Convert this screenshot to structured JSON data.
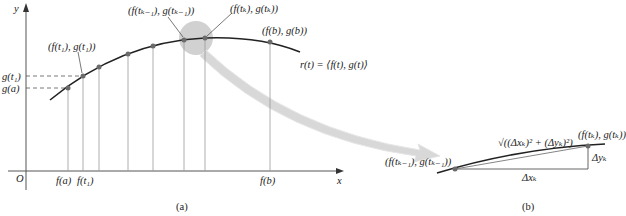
{
  "figure_a": {
    "caption": "(a)",
    "axis_x_label": "x",
    "axis_y_label": "y",
    "origin_label": "O",
    "point_labels": {
      "p1": "(f(t₁), g(t₁))",
      "pk_minus_1": "(f(tₖ₋₁), g(tₖ₋₁))",
      "pk": "(f(tₖ), g(tₖ))",
      "pb": "(f(b), g(b))"
    },
    "curve_label": "r(t) = ⟨f(t), g(t)⟩",
    "x_ticks": [
      "f(a)",
      "f(t₁)",
      "f(b)"
    ],
    "y_ticks": [
      "g(t₁)",
      "g(a)"
    ]
  },
  "figure_b": {
    "caption": "(b)",
    "segment_label": "√((Δxₖ)² + (Δyₖ)²)",
    "left_point_label": "(f(tₖ₋₁), g(tₖ₋₁))",
    "right_point_label": "(f(tₖ), g(tₖ))",
    "dx_label": "Δxₖ",
    "dy_label": "Δyₖ"
  },
  "colors": {
    "curve": "#2a2a2a",
    "point": "#6b6b6b",
    "gridline": "#9a9a9a",
    "highlight": "#c8c8c8",
    "arrow": "#d9d9d9"
  }
}
